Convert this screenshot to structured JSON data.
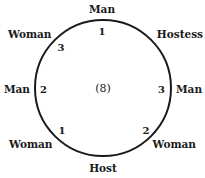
{
  "diagram": {
    "type": "circular-seating-arrangement",
    "center_label": "(8)",
    "circle": {
      "cx": 103,
      "cy": 88,
      "r": 68,
      "stroke": "#1a1a1a"
    },
    "seats": [
      {
        "position": "top",
        "label": "Man",
        "number": "1"
      },
      {
        "position": "top-right",
        "label": "Hostess",
        "number": ""
      },
      {
        "position": "right",
        "label": "Man",
        "number": "3"
      },
      {
        "position": "bottom-right",
        "label": "Woman",
        "number": "2"
      },
      {
        "position": "bottom",
        "label": "Host",
        "number": ""
      },
      {
        "position": "bottom-left",
        "label": "Woman",
        "number": "1"
      },
      {
        "position": "left",
        "label": "Man",
        "number": "2"
      },
      {
        "position": "top-left",
        "label": "Woman",
        "number": "3"
      }
    ]
  }
}
